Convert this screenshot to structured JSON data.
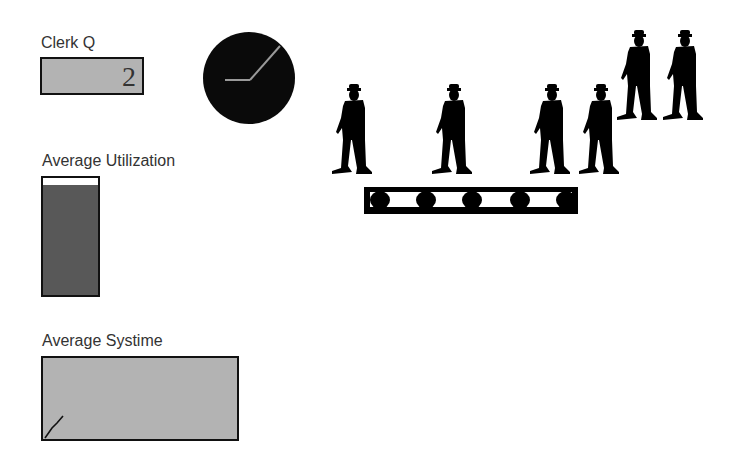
{
  "clerk_queue": {
    "label": "Clerk Q",
    "value": "2"
  },
  "clock": {
    "icon": "clock-icon",
    "hands": "hour hand pointing left, minute hand pointing upper-right"
  },
  "average_utilization": {
    "label": "Average Utilization",
    "fill_percent": 94,
    "fill_color": "#585858"
  },
  "average_systime": {
    "label": "Average Systime",
    "plot": "short rising line from bottom-left corner"
  },
  "animation": {
    "customers_on_conveyor": 5,
    "customers_waiting_raised": 2,
    "conveyor_rollers": 5
  },
  "colors": {
    "panel_gray": "#b3b3b3",
    "silhouette": "#000000",
    "label_text": "#333333"
  }
}
